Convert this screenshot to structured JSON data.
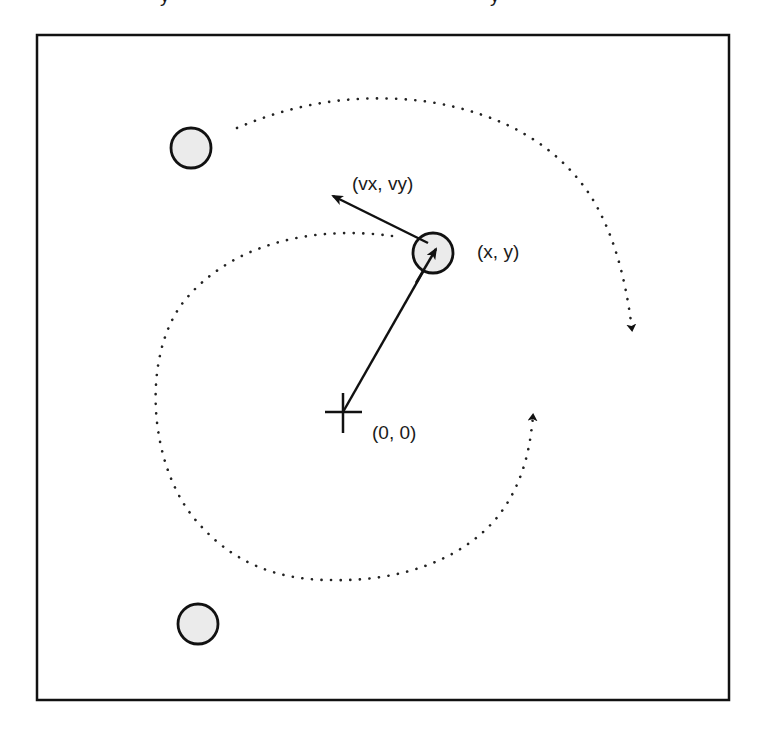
{
  "diagram": {
    "type": "particle-orbit-schematic",
    "frame": {
      "x": 36,
      "y": 34,
      "width": 694,
      "height": 667,
      "stroke": "#111111"
    },
    "origin": {
      "label": "(0, 0)",
      "x": 343,
      "y": 412
    },
    "particle": {
      "label": "(x, y)",
      "cx": 433,
      "cy": 253,
      "r": 20,
      "fill": "#ebebeb"
    },
    "velocity": {
      "label": "(vx, vy)"
    },
    "other_particles": [
      {
        "cx": 191,
        "cy": 148,
        "r": 20
      },
      {
        "cx": 198,
        "cy": 624,
        "r": 20
      }
    ],
    "colors": {
      "stroke": "#111111",
      "particle_fill": "#ebebeb",
      "text": "#1a1a1a",
      "background": "#ffffff"
    }
  },
  "cropped_header": {
    "text": "y y"
  }
}
